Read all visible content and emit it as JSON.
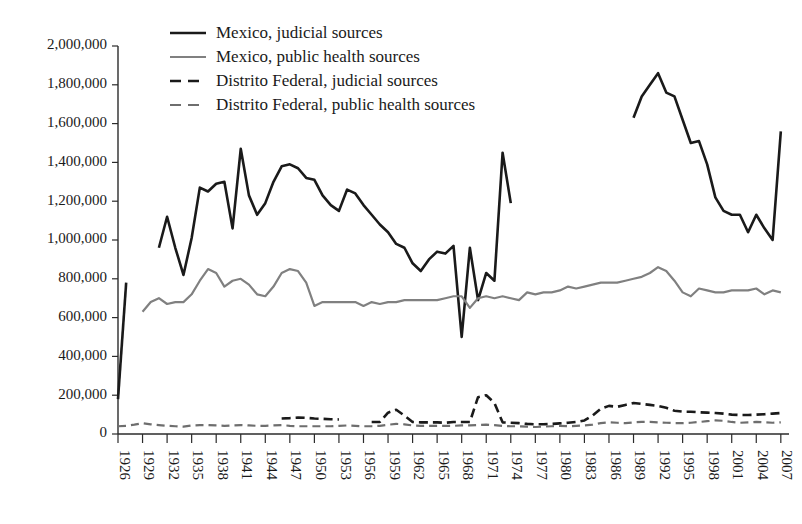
{
  "chart_data": {
    "type": "line",
    "title": "",
    "xlabel": "",
    "ylabel": "",
    "xlim": [
      1926,
      2008
    ],
    "ylim": [
      0,
      2000000
    ],
    "grid": false,
    "legend_position": "top-center",
    "y_ticks": [
      0,
      200000,
      400000,
      600000,
      800000,
      1000000,
      1200000,
      1400000,
      1600000,
      1800000,
      2000000
    ],
    "y_tick_labels": [
      "0",
      "200,000",
      "400,000",
      "600,000",
      "800,000",
      "1,000,000",
      "1,200,000",
      "1,400,000",
      "1,600,000",
      "1,800,000",
      "2,000,000"
    ],
    "x_ticks": [
      1926,
      1929,
      1932,
      1935,
      1938,
      1941,
      1944,
      1947,
      1950,
      1953,
      1956,
      1959,
      1962,
      1965,
      1968,
      1971,
      1974,
      1977,
      1980,
      1983,
      1986,
      1989,
      1992,
      1995,
      1998,
      2001,
      2004,
      2007
    ],
    "x_tick_labels": [
      "1926",
      "1929",
      "1932",
      "1935",
      "1938",
      "1941",
      "1944",
      "1947",
      "1950",
      "1953",
      "1956",
      "1959",
      "1962",
      "1965",
      "1968",
      "1971",
      "1974",
      "1977",
      "1980",
      "1983",
      "1986",
      "1989",
      "1992",
      "1995",
      "1998",
      "2001",
      "2004",
      "2007"
    ],
    "series": [
      {
        "name": "Mexico, judicial sources",
        "color": "#1a1a1a",
        "style": "solid",
        "width": 2.6,
        "segments": [
          {
            "x": [
              1926,
              1927
            ],
            "values": [
              180000,
              780000
            ]
          },
          {
            "x": [
              1931,
              1932,
              1933,
              1934,
              1935,
              1936,
              1937,
              1938,
              1939,
              1940,
              1941,
              1942,
              1943,
              1944,
              1945,
              1946,
              1947,
              1948,
              1949,
              1950,
              1951,
              1952,
              1953,
              1954,
              1955,
              1956,
              1957,
              1958,
              1959,
              1960,
              1961,
              1962,
              1963,
              1964,
              1965,
              1966,
              1967,
              1968,
              1969,
              1970,
              1971,
              1972,
              1973,
              1974,
              1975,
              1976
            ],
            "values": [
              960000,
              1120000,
              960000,
              820000,
              1010000,
              1270000,
              1250000,
              1290000,
              1300000,
              1060000,
              1470000,
              1230000,
              1130000,
              1190000,
              1300000,
              1380000,
              1390000,
              1370000,
              1320000,
              1310000,
              1230000,
              1180000,
              1150000,
              1260000,
              1240000,
              1180000,
              1130000,
              1080000,
              1040000,
              980000,
              960000,
              880000,
              840000,
              900000,
              940000,
              930000,
              970000,
              500000,
              960000,
              690000,
              830000,
              790000,
              1450000,
              1190000
            ]
          },
          {
            "x": [
              1989,
              1990,
              1991,
              1992,
              1993,
              1994,
              1995,
              1996,
              1997,
              1998,
              1999,
              2000,
              2001,
              2002,
              2003,
              2004,
              2005,
              2006,
              2007
            ],
            "values": [
              1630000,
              1740000,
              1800000,
              1860000,
              1760000,
              1740000,
              1620000,
              1500000,
              1510000,
              1390000,
              1220000,
              1150000,
              1130000,
              1130000,
              1040000,
              1130000,
              1060000,
              1000000,
              1560000
            ]
          }
        ]
      },
      {
        "name": "Mexico, public health sources",
        "color": "#808080",
        "style": "solid",
        "width": 2.2,
        "segments": [
          {
            "x": [
              1929,
              1930,
              1931,
              1932,
              1933,
              1934,
              1935,
              1936,
              1937,
              1938,
              1939,
              1940,
              1941,
              1942,
              1943,
              1944,
              1945,
              1946,
              1947,
              1948,
              1949,
              1950,
              1951,
              1952,
              1953,
              1954,
              1955,
              1956,
              1957,
              1958,
              1959,
              1960,
              1961,
              1962,
              1963,
              1964,
              1965,
              1966,
              1967,
              1968,
              1969,
              1970,
              1971,
              1972,
              1973,
              1974,
              1975,
              1976,
              1977,
              1978,
              1979,
              1980,
              1981,
              1982,
              1983,
              1984,
              1985,
              1986,
              1987,
              1988,
              1989,
              1990,
              1991,
              1992,
              1993,
              1994,
              1995,
              1996,
              1997,
              1998,
              1999,
              2000,
              2001,
              2002,
              2003,
              2004,
              2005,
              2006,
              2007
            ],
            "values": [
              630000,
              680000,
              700000,
              670000,
              680000,
              680000,
              720000,
              790000,
              850000,
              830000,
              760000,
              790000,
              800000,
              770000,
              720000,
              710000,
              760000,
              830000,
              850000,
              840000,
              780000,
              660000,
              680000,
              680000,
              680000,
              680000,
              680000,
              660000,
              680000,
              670000,
              680000,
              680000,
              690000,
              690000,
              690000,
              690000,
              690000,
              700000,
              710000,
              710000,
              650000,
              700000,
              710000,
              700000,
              710000,
              700000,
              690000,
              730000,
              720000,
              730000,
              730000,
              740000,
              760000,
              750000,
              760000,
              770000,
              780000,
              780000,
              780000,
              790000,
              800000,
              810000,
              830000,
              860000,
              840000,
              790000,
              730000,
              710000,
              750000,
              740000,
              730000,
              730000,
              740000,
              740000,
              740000,
              750000,
              720000,
              740000,
              730000
            ]
          }
        ]
      },
      {
        "name": "Distrito Federal, judicial sources",
        "color": "#1a1a1a",
        "style": "dashed",
        "width": 2.6,
        "dasharray": "9,5",
        "segments": [
          {
            "x": [
              1946,
              1947,
              1948,
              1949,
              1950,
              1951,
              1952,
              1953
            ],
            "values": [
              80000,
              82000,
              85000,
              83000,
              80000,
              78000,
              76000,
              75000
            ]
          },
          {
            "x": [
              1957,
              1958,
              1959,
              1960,
              1961,
              1962,
              1963,
              1964,
              1965,
              1966,
              1967,
              1968,
              1969,
              1970,
              1971,
              1972,
              1973,
              1974,
              1975,
              1976,
              1977,
              1978,
              1979,
              1980,
              1981,
              1982,
              1983,
              1984,
              1985,
              1986,
              1987,
              1988,
              1989,
              1990,
              1991,
              1992,
              1993,
              1994,
              1995,
              1996,
              1997,
              1998,
              1999,
              2000,
              2001,
              2002,
              2003,
              2004,
              2005,
              2006,
              2007
            ],
            "values": [
              62000,
              62000,
              110000,
              125000,
              95000,
              62000,
              60000,
              60000,
              60000,
              58000,
              62000,
              62000,
              62000,
              190000,
              200000,
              160000,
              60000,
              58000,
              56000,
              52000,
              50000,
              50000,
              52000,
              55000,
              58000,
              62000,
              70000,
              95000,
              130000,
              145000,
              140000,
              150000,
              160000,
              155000,
              150000,
              145000,
              135000,
              120000,
              115000,
              115000,
              112000,
              110000,
              108000,
              105000,
              100000,
              98000,
              98000,
              100000,
              102000,
              105000,
              108000
            ]
          }
        ]
      },
      {
        "name": "Distrito Federal, public health sources",
        "color": "#6e6e6e",
        "style": "dashed",
        "width": 2.2,
        "dasharray": "8,5",
        "segments": [
          {
            "x": [
              1926,
              1927,
              1928,
              1929,
              1930,
              1931,
              1932,
              1933,
              1934,
              1935,
              1936,
              1937,
              1938,
              1939,
              1940,
              1941,
              1942,
              1943,
              1944,
              1945,
              1946,
              1947,
              1948,
              1949,
              1950,
              1951,
              1952,
              1953,
              1954,
              1955,
              1956,
              1957,
              1958,
              1959,
              1960,
              1961,
              1962,
              1963,
              1964,
              1965,
              1966,
              1967,
              1968,
              1969,
              1970,
              1971,
              1972,
              1973,
              1974,
              1975,
              1976,
              1977,
              1978,
              1979,
              1980,
              1981,
              1982,
              1983,
              1984,
              1985,
              1986,
              1987,
              1988,
              1989,
              1990,
              1991,
              1992,
              1993,
              1994,
              1995,
              1996,
              1997,
              1998,
              1999,
              2000,
              2001,
              2002,
              2003,
              2004,
              2005,
              2006,
              2007
            ],
            "values": [
              40000,
              42000,
              48000,
              56000,
              50000,
              46000,
              42000,
              40000,
              38000,
              44000,
              46000,
              46000,
              44000,
              42000,
              44000,
              46000,
              44000,
              42000,
              42000,
              44000,
              46000,
              42000,
              40000,
              40000,
              40000,
              40000,
              40000,
              42000,
              44000,
              42000,
              40000,
              40000,
              42000,
              48000,
              52000,
              50000,
              44000,
              42000,
              42000,
              42000,
              42000,
              42000,
              44000,
              44000,
              46000,
              48000,
              46000,
              42000,
              40000,
              40000,
              38000,
              36000,
              38000,
              40000,
              42000,
              40000,
              42000,
              44000,
              48000,
              56000,
              60000,
              58000,
              56000,
              60000,
              62000,
              62000,
              60000,
              58000,
              56000,
              56000,
              58000,
              62000,
              66000,
              70000,
              68000,
              62000,
              58000,
              60000,
              62000,
              60000,
              58000,
              60000
            ]
          }
        ]
      }
    ]
  },
  "legend": {
    "entries": [
      {
        "label": "Mexico, judicial sources"
      },
      {
        "label": "Mexico, public health sources"
      },
      {
        "label": "Distrito Federal, judicial sources"
      },
      {
        "label": "Distrito Federal, public health sources"
      }
    ]
  }
}
